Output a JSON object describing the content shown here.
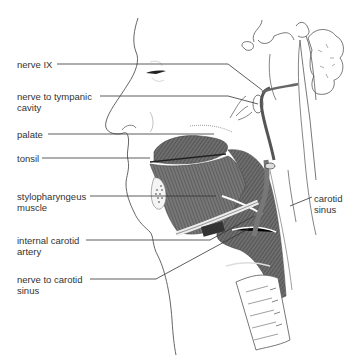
{
  "figure": {
    "colors": {
      "line": "#333333",
      "muscle": "#6a6a6a",
      "muscle_dark": "#4a4a4a",
      "background": "#ffffff"
    }
  },
  "labels": {
    "left": [
      {
        "id": "nerve-ix",
        "lines": [
          "nerve  IX"
        ]
      },
      {
        "id": "nerve-to-tympanic-cavity",
        "lines": [
          "nerve to tympanic",
          "cavity"
        ]
      },
      {
        "id": "palate",
        "lines": [
          "palate"
        ]
      },
      {
        "id": "tonsil",
        "lines": [
          "tonsil"
        ]
      },
      {
        "id": "stylopharyngeus-muscle",
        "lines": [
          "stylopharyngeus",
          "muscle"
        ]
      },
      {
        "id": "internal-carotid-artery",
        "lines": [
          "internal carotid",
          "artery"
        ]
      },
      {
        "id": "nerve-to-carotid-sinus",
        "lines": [
          "nerve to carotid",
          "sinus"
        ]
      }
    ],
    "right": [
      {
        "id": "carotid-sinus",
        "lines": [
          "carotid",
          "sinus"
        ]
      }
    ]
  }
}
